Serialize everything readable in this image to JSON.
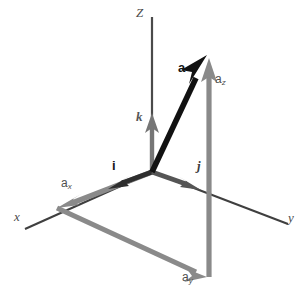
{
  "diagram": {
    "background_color": "#ffffff",
    "width": 305,
    "height": 296,
    "colors": {
      "axis": "#4a4a4a",
      "vector_a": "#111111",
      "unit_vector": "#333333",
      "component": "#808080",
      "component_light": "#8a8a8a",
      "label_dark": "#161616",
      "label_gray": "#4f4f4f"
    },
    "origin": {
      "x": 152,
      "y": 172
    },
    "axes": [
      {
        "name": "z-axis",
        "label": "Z",
        "label_x": 136,
        "label_y": 6,
        "from": {
          "x": 152,
          "y": 172
        },
        "to": {
          "x": 152,
          "y": 17
        }
      },
      {
        "name": "x-axis",
        "label": "x",
        "label_x": 14,
        "label_y": 210,
        "from": {
          "x": 152,
          "y": 172
        },
        "to": {
          "x": 25,
          "y": 229
        }
      },
      {
        "name": "y-axis",
        "label": "y",
        "label_x": 288,
        "label_y": 211,
        "from": {
          "x": 152,
          "y": 172
        },
        "to": {
          "x": 288,
          "y": 224
        }
      }
    ],
    "unit_vectors": [
      {
        "name": "i",
        "label": "i",
        "label_x": 112,
        "label_y": 160,
        "from": {
          "x": 152,
          "y": 172
        },
        "to": {
          "x": 108,
          "y": 189
        }
      },
      {
        "name": "j",
        "label": "j",
        "label_x": 197,
        "label_y": 160,
        "from": {
          "x": 152,
          "y": 172
        },
        "to": {
          "x": 201,
          "y": 190
        }
      },
      {
        "name": "k",
        "label": "k",
        "label_x": 136,
        "label_y": 110,
        "from": {
          "x": 152,
          "y": 172
        },
        "to": {
          "x": 152,
          "y": 113
        }
      }
    ],
    "vector": {
      "name": "a",
      "label": "a",
      "label_x": 178,
      "label_y": 62,
      "from": {
        "x": 152,
        "y": 172
      },
      "to": {
        "x": 207,
        "y": 55
      }
    },
    "components": [
      {
        "name": "a-x-component",
        "label": "a",
        "sub": "x",
        "label_x": 61,
        "label_y": 178,
        "from": {
          "x": 152,
          "y": 172
        },
        "to": {
          "x": 57,
          "y": 208
        }
      },
      {
        "name": "a-y-component",
        "label": "a",
        "sub": "y",
        "label_x": 182,
        "label_y": 272,
        "from": {
          "x": 57,
          "y": 208
        },
        "to": {
          "x": 207,
          "y": 277
        }
      },
      {
        "name": "a-z-component",
        "label": "a",
        "sub": "z",
        "label_x": 215,
        "label_y": 74,
        "from": {
          "x": 209,
          "y": 277
        },
        "to": {
          "x": 209,
          "y": 58
        }
      }
    ],
    "projection_lines": [
      {
        "name": "vertical-projection-line",
        "from": {
          "x": 209,
          "y": 277
        },
        "to": {
          "x": 209,
          "y": 58
        }
      }
    ]
  }
}
